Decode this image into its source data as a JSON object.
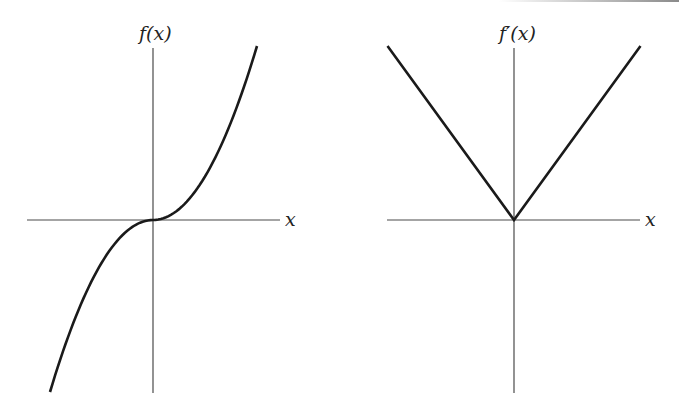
{
  "chart_data": [
    {
      "type": "line",
      "title": "",
      "ylabel": "f(x)",
      "xlabel": "x",
      "grid": false,
      "legend": null,
      "description": "Cubic-like curve passing through origin with horizontal tangent at x=0",
      "function": "f(x) = x|x| (shape: concave down for x<0, concave up for x>0)",
      "x": [
        -1.0,
        -0.75,
        -0.5,
        -0.25,
        0,
        0.25,
        0.5,
        0.75,
        1.0
      ],
      "y": [
        -1.0,
        -0.5625,
        -0.25,
        -0.0625,
        0,
        0.0625,
        0.25,
        0.5625,
        1.0
      ],
      "xlim": [
        -1.2,
        1.2
      ],
      "ylim": [
        -1.0,
        1.0
      ]
    },
    {
      "type": "line",
      "title": "",
      "ylabel": "f′(x)",
      "xlabel": "x",
      "grid": false,
      "legend": null,
      "description": "V-shaped derivative with vertex at origin",
      "function": "f'(x) = 2|x|",
      "x": [
        -1.0,
        0,
        1.0
      ],
      "y": [
        2.0,
        0,
        2.0
      ],
      "xlim": [
        -1.0,
        1.0
      ],
      "ylim": [
        -2.0,
        2.0
      ]
    }
  ],
  "plots": {
    "left": {
      "y_label": "f(x)",
      "x_label": "x"
    },
    "right": {
      "y_label": "f′(x)",
      "x_label": "x"
    }
  }
}
